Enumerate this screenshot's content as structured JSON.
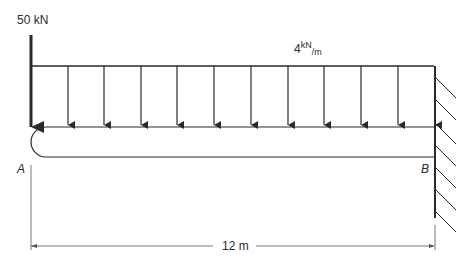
{
  "diagram": {
    "type": "cantilever-beam",
    "point_load": {
      "label": "50 kN",
      "position": "A",
      "direction": "down"
    },
    "distributed_load": {
      "magnitude": "4",
      "unit_num": "kN",
      "unit_den": "m",
      "arrows": 11
    },
    "supports": {
      "A": "free end",
      "B": "fixed wall"
    },
    "labels": {
      "A": "A",
      "B": "B"
    },
    "dimension": {
      "label": "12 m"
    }
  },
  "colors": {
    "line": "#2a2a2a",
    "dim": "#555555"
  }
}
